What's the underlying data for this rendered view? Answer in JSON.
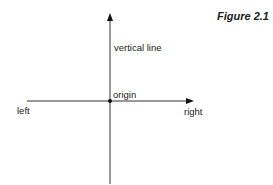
{
  "figure": {
    "caption": "Figure 2.1"
  },
  "labels": {
    "vertical_line": "vertical line",
    "origin": "origin",
    "left": "left",
    "right": "right"
  },
  "colors": {
    "line": "#1a1a1a",
    "background": "#ffffff"
  }
}
